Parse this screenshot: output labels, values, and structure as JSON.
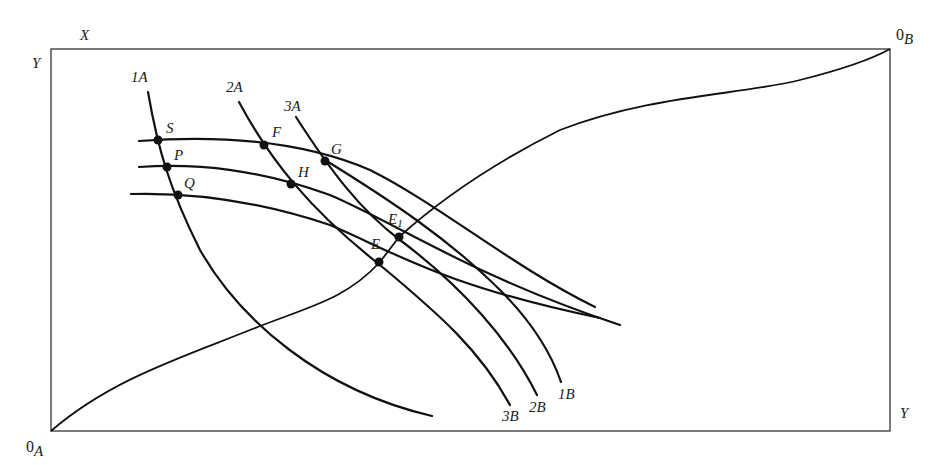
{
  "diagram": {
    "type": "edgeworth-box",
    "axes": {
      "top_left_x_label": "X",
      "top_left_y_label": "Y",
      "bottom_right_y_label": "Y",
      "origin_a": "0",
      "origin_a_sub": "A",
      "origin_b": "0",
      "origin_b_sub": "B"
    },
    "a_curves": [
      {
        "label": "1",
        "sub": "A"
      },
      {
        "label": "2",
        "sub": "A"
      },
      {
        "label": "3",
        "sub": "A"
      }
    ],
    "b_curves": [
      {
        "label": "1",
        "sub": "B"
      },
      {
        "label": "2",
        "sub": "B"
      },
      {
        "label": "3",
        "sub": "B"
      }
    ],
    "points": {
      "S": "S",
      "P": "P",
      "Q": "Q",
      "F": "F",
      "G": "G",
      "H": "H",
      "E": "E",
      "E1": "E",
      "E1_sub": "1"
    }
  }
}
